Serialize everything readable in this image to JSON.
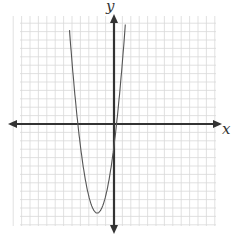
{
  "chart_data": {
    "type": "line",
    "title": "",
    "xlabel": "x",
    "ylabel": "y",
    "grid": true,
    "grid_color": "#d9d9d9",
    "axis_color": "#333333",
    "curve_color": "#555555",
    "xlim": [
      -12.5,
      12.5
    ],
    "ylim": [
      -12.5,
      12.5
    ],
    "series": [
      {
        "name": "parabola",
        "equation": "y = 2(x + 2)^2 - 10.6",
        "vertex": [
          -2,
          -10.6
        ],
        "x_intercepts": [
          -4.3,
          0.3
        ],
        "y_intercept": -2.6
      }
    ]
  },
  "labels": {
    "x_axis": "x",
    "y_axis": "y"
  }
}
